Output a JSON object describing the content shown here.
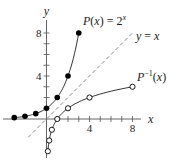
{
  "chart_data": {
    "type": "line",
    "title": "",
    "xlabel": "x",
    "ylabel": "y",
    "x_ticks": [
      4,
      8
    ],
    "y_ticks": [
      4,
      8
    ],
    "xlim": [
      -3,
      8
    ],
    "ylim": [
      -3,
      8
    ],
    "grid": false,
    "series": [
      {
        "name": "P(x) = 2^x",
        "label_main": "P(x) = 2",
        "label_sup": "x",
        "marker": "filled-circle",
        "color": "#000000",
        "points": [
          [
            -3,
            0.125
          ],
          [
            -2,
            0.25
          ],
          [
            -1,
            0.5
          ],
          [
            0,
            1
          ],
          [
            1,
            2
          ],
          [
            2,
            4
          ],
          [
            3,
            8
          ]
        ]
      },
      {
        "name": "P^-1(x)",
        "label_main": "P",
        "label_sup": "−1",
        "label_tail": "(x)",
        "marker": "open-circle",
        "color": "#000000",
        "points": [
          [
            0.125,
            -3
          ],
          [
            0.25,
            -2
          ],
          [
            0.5,
            -1
          ],
          [
            1,
            0
          ],
          [
            2,
            1
          ],
          [
            4,
            2
          ],
          [
            8,
            3
          ]
        ]
      },
      {
        "name": "y = x",
        "label": "y = x",
        "style": "dashed",
        "color": "#888888",
        "points": [
          [
            -1.7,
            -1.7
          ],
          [
            8,
            8
          ]
        ]
      }
    ]
  }
}
